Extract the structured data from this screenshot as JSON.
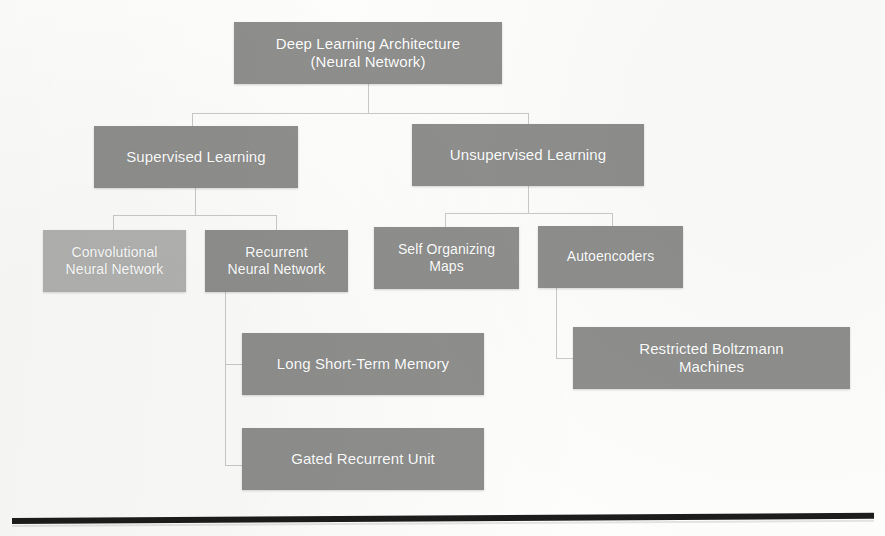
{
  "diagram": {
    "type": "tree-hierarchy",
    "title_node": "root",
    "colors": {
      "node_dark": "#8e8f8d",
      "node_light": "#b2b3b1",
      "node_text": "#ffffff",
      "connector": "#c9c9c7",
      "rule": "#1c1c1c",
      "background": "#fdfdfc"
    },
    "nodes": [
      {
        "id": "root",
        "label": "Deep Learning Architecture\n(Neural Network)",
        "level": 0,
        "shade": "dark",
        "x": 234,
        "y": 22,
        "w": 268,
        "h": 62,
        "font_size": 15
      },
      {
        "id": "supervised",
        "label": "Supervised Learning",
        "level": 1,
        "shade": "dark",
        "x": 94,
        "y": 126,
        "w": 204,
        "h": 62,
        "font_size": 15
      },
      {
        "id": "unsupervised",
        "label": "Unsupervised Learning",
        "level": 1,
        "shade": "dark",
        "x": 412,
        "y": 124,
        "w": 232,
        "h": 62,
        "font_size": 15
      },
      {
        "id": "cnn",
        "label": "Convolutional\nNeural Network",
        "level": 2,
        "shade": "light",
        "x": 43,
        "y": 230,
        "w": 143,
        "h": 62,
        "font_size": 14
      },
      {
        "id": "rnn",
        "label": "Recurrent\nNeural Network",
        "level": 2,
        "shade": "dark",
        "x": 205,
        "y": 230,
        "w": 143,
        "h": 62,
        "font_size": 14
      },
      {
        "id": "som",
        "label": "Self Organizing\nMaps",
        "level": 2,
        "shade": "dark",
        "x": 374,
        "y": 227,
        "w": 145,
        "h": 62,
        "font_size": 14
      },
      {
        "id": "autoencoders",
        "label": "Autoencoders",
        "level": 2,
        "shade": "dark",
        "x": 538,
        "y": 226,
        "w": 145,
        "h": 62,
        "font_size": 14
      },
      {
        "id": "lstm",
        "label": "Long Short-Term Memory",
        "level": 3,
        "shade": "dark",
        "x": 242,
        "y": 333,
        "w": 242,
        "h": 62,
        "font_size": 15
      },
      {
        "id": "rbm",
        "label": "Restricted Boltzmann\nMachines",
        "level": 3,
        "shade": "dark",
        "x": 573,
        "y": 327,
        "w": 277,
        "h": 62,
        "font_size": 15
      },
      {
        "id": "gru",
        "label": "Gated Recurrent Unit",
        "level": 3,
        "shade": "dark",
        "x": 242,
        "y": 428,
        "w": 242,
        "h": 62,
        "font_size": 15
      }
    ],
    "edges": [
      {
        "from": "root",
        "to": "supervised"
      },
      {
        "from": "root",
        "to": "unsupervised"
      },
      {
        "from": "supervised",
        "to": "cnn"
      },
      {
        "from": "supervised",
        "to": "rnn"
      },
      {
        "from": "unsupervised",
        "to": "som"
      },
      {
        "from": "unsupervised",
        "to": "autoencoders"
      },
      {
        "from": "rnn",
        "to": "lstm"
      },
      {
        "from": "rnn",
        "to": "gru"
      },
      {
        "from": "autoencoders",
        "to": "rbm"
      }
    ]
  },
  "labels": {
    "root": "Deep Learning Architecture\n(Neural Network)",
    "supervised": "Supervised Learning",
    "unsupervised": "Unsupervised Learning",
    "cnn": "Convolutional\nNeural Network",
    "rnn": "Recurrent\nNeural Network",
    "som": "Self Organizing\nMaps",
    "autoencoders": "Autoencoders",
    "lstm": "Long Short-Term Memory",
    "rbm": "Restricted Boltzmann\nMachines",
    "gru": "Gated Recurrent Unit"
  },
  "connectors": [
    {
      "name": "root-stem",
      "type": "v",
      "x": 368,
      "y": 84,
      "len": 29
    },
    {
      "name": "root-bus",
      "type": "h",
      "x": 192,
      "y": 113,
      "len": 336
    },
    {
      "name": "root-to-supervised",
      "type": "v",
      "x": 192,
      "y": 113,
      "len": 13
    },
    {
      "name": "root-to-unsupervised",
      "type": "v",
      "x": 528,
      "y": 113,
      "len": 11
    },
    {
      "name": "supervised-stem",
      "type": "v",
      "x": 195,
      "y": 188,
      "len": 27
    },
    {
      "name": "supervised-bus",
      "type": "h",
      "x": 113,
      "y": 215,
      "len": 163
    },
    {
      "name": "supervised-to-cnn",
      "type": "v",
      "x": 113,
      "y": 215,
      "len": 15
    },
    {
      "name": "supervised-to-rnn",
      "type": "v",
      "x": 276,
      "y": 215,
      "len": 15
    },
    {
      "name": "unsupervised-stem",
      "type": "v",
      "x": 528,
      "y": 186,
      "len": 27
    },
    {
      "name": "unsupervised-bus",
      "type": "h",
      "x": 445,
      "y": 213,
      "len": 167
    },
    {
      "name": "unsupervised-to-som",
      "type": "v",
      "x": 445,
      "y": 213,
      "len": 14
    },
    {
      "name": "unsupervised-to-ae",
      "type": "v",
      "x": 612,
      "y": 213,
      "len": 13
    },
    {
      "name": "rnn-stem",
      "type": "v",
      "x": 225,
      "y": 292,
      "len": 173
    },
    {
      "name": "rnn-to-lstm",
      "type": "h",
      "x": 225,
      "y": 364,
      "len": 17
    },
    {
      "name": "rnn-to-gru",
      "type": "h",
      "x": 225,
      "y": 465,
      "len": 17
    },
    {
      "name": "ae-stem",
      "type": "v",
      "x": 556,
      "y": 288,
      "len": 70
    },
    {
      "name": "ae-to-rbm",
      "type": "h",
      "x": 556,
      "y": 358,
      "len": 17
    }
  ]
}
